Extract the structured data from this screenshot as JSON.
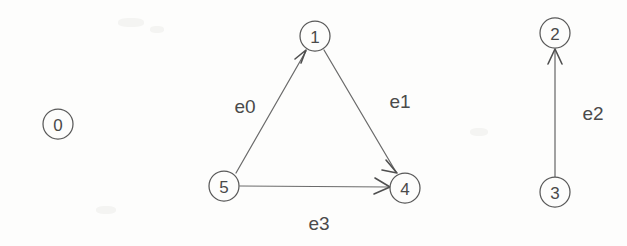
{
  "diagram": {
    "type": "directed-graph",
    "background_color": "#fdfdfc",
    "node_stroke_color": "#595959",
    "edge_stroke_color": "#6b6b6b",
    "text_color": "#4a4a4a",
    "node_radius": 15,
    "nodes": [
      {
        "id": "0",
        "label": "0",
        "cx": 58,
        "cy": 124
      },
      {
        "id": "1",
        "label": "1",
        "cx": 315,
        "cy": 36
      },
      {
        "id": "2",
        "label": "2",
        "cx": 555,
        "cy": 33
      },
      {
        "id": "3",
        "label": "3",
        "cx": 555,
        "cy": 192
      },
      {
        "id": "4",
        "label": "4",
        "cx": 405,
        "cy": 188
      },
      {
        "id": "5",
        "label": "5",
        "cx": 224,
        "cy": 186
      }
    ],
    "edges": [
      {
        "id": "e0",
        "label": "e0",
        "from": "5",
        "to": "1",
        "label_x": 245,
        "label_y": 106
      },
      {
        "id": "e1",
        "label": "e1",
        "from": "1",
        "to": "4",
        "label_x": 400,
        "label_y": 101
      },
      {
        "id": "e2",
        "label": "e2",
        "from": "3",
        "to": "2",
        "label_x": 593,
        "label_y": 113
      },
      {
        "id": "e3",
        "label": "e3",
        "from": "5",
        "to": "4",
        "label_x": 319,
        "label_y": 223
      }
    ],
    "isolated_nodes": [
      "0"
    ]
  }
}
